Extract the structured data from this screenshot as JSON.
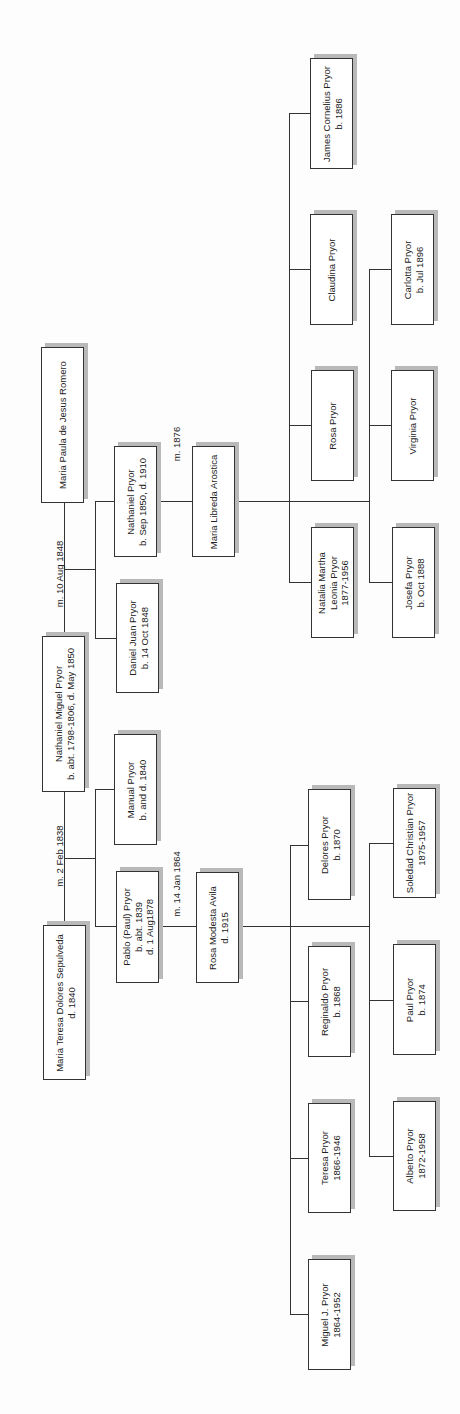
{
  "people": {
    "maria_paula": {
      "name": "Maria Paula de Jesus Romero",
      "dates": ""
    },
    "nathaniel_miguel": {
      "name": "Nathaniel Miguel Pryor",
      "dates": "b. abt. 1798-1806, d. May 1850"
    },
    "maria_teresa": {
      "name": "Maria Teresa Dolores Sepulveda",
      "dates": "d. 1840"
    },
    "nathaniel": {
      "name": "Nathaniel Pryor",
      "dates": "b. Sep 1850, d. 1910"
    },
    "daniel_juan": {
      "name": "Daniel Juan Pryor",
      "dates": "b. 14 Oct 1848"
    },
    "manual": {
      "name": "Manual Pryor",
      "dates": "b. and d. 1840"
    },
    "pablo": {
      "name": "Pablo (Paul) Pryor",
      "dates": "b. abt. 1839",
      "dates2": "d. 1 Aug1878"
    },
    "maria_libreda": {
      "name": "Maria Libreda Arostica",
      "dates": ""
    },
    "rosa_modesta": {
      "name": "Rosa Modesta Avila",
      "dates": "d. 1915"
    },
    "james_cornelius": {
      "name": "James Cornelius Pryor",
      "dates": "b. 1886"
    },
    "claudina": {
      "name": "Claudina Pryor",
      "dates": ""
    },
    "carlotta": {
      "name": "Carlotta Pryor",
      "dates": "b. Jul 1896"
    },
    "rosa": {
      "name": "Rosa Pryor",
      "dates": ""
    },
    "virginia": {
      "name": "Virginia Pryor",
      "dates": ""
    },
    "natalia": {
      "name": "Natalia Martha",
      "name2": "Leonia Pryor",
      "dates": "1877-1956"
    },
    "josefa": {
      "name": "Josefa Pryor",
      "dates": "b. Oct 1888"
    },
    "delores": {
      "name": "Delores Pryor",
      "dates": "b. 1870"
    },
    "soledad": {
      "name": "Soledad Christian Pryor",
      "dates": "1875-1957"
    },
    "reginaldo": {
      "name": "Reginaldo Pryor",
      "dates": "b. 1868"
    },
    "paul": {
      "name": "Paul Pryor",
      "dates": "b. 1874"
    },
    "teresa": {
      "name": "Teresa Pryor",
      "dates": "1866-1946"
    },
    "alberto": {
      "name": "Alberto Pryor",
      "dates": "1872-1958"
    },
    "miguel_j": {
      "name": "Miguel J. Pryor",
      "dates": "1864-1952"
    }
  },
  "marriages": {
    "m1": "m. 10 Aug 1848",
    "m2": "m. 2 Feb 1838",
    "m3": "m. 1876",
    "m4": "m. 14 Jan 1864"
  }
}
